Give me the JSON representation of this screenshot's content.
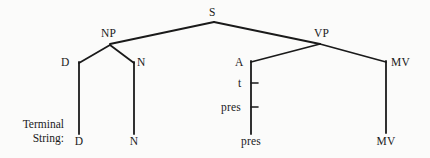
{
  "figure": {
    "type": "phrase-structure-tree",
    "background_color": "#fbfbfa",
    "ink_color": "#1a1a1a",
    "caption": {
      "line1": "Terminal",
      "line2": "String:"
    }
  },
  "nodes": {
    "s": "S",
    "np": "NP",
    "vp": "VP",
    "d": "D",
    "n": "N",
    "a": "A",
    "t": "t",
    "pres": "pres",
    "mv": "MV"
  },
  "terminals": {
    "d": "D",
    "n": "N",
    "pres": "pres",
    "mv": "MV"
  },
  "layout": {
    "node_positions": {
      "s": {
        "x": 215,
        "y": 12
      },
      "np": {
        "x": 110,
        "y": 33
      },
      "vp": {
        "x": 322,
        "y": 33
      },
      "d": {
        "x": 65,
        "y": 62
      },
      "n": {
        "x": 140,
        "y": 62
      },
      "a": {
        "x": 240,
        "y": 62
      },
      "t": {
        "x": 240,
        "y": 85
      },
      "pres": {
        "x": 240,
        "y": 111
      },
      "mv": {
        "x": 406,
        "y": 62
      }
    },
    "terminal_positions": {
      "d": {
        "x": 79,
        "y": 141
      },
      "n": {
        "x": 134,
        "y": 141
      },
      "pres": {
        "x": 251,
        "y": 141
      },
      "mv": {
        "x": 386,
        "y": 141
      }
    },
    "edges": [
      {
        "from": "s",
        "to": "np",
        "points": "214,22 110,44"
      },
      {
        "from": "s",
        "to": "vp",
        "points": "214,22 320,44"
      },
      {
        "from": "np",
        "to": "d",
        "points": "110,45 79,63"
      },
      {
        "from": "np",
        "to": "n",
        "points": "110,45 134,63"
      },
      {
        "from": "vp",
        "to": "a",
        "points": "320,44 251,62"
      },
      {
        "from": "vp",
        "to": "mv",
        "points": "320,44 386,62"
      },
      {
        "from": "d",
        "to": "terminal-d",
        "points": "79,63 79,134"
      },
      {
        "from": "n",
        "to": "terminal-n",
        "points": "134,63 134,134"
      },
      {
        "from": "a",
        "to": "terminal-pres",
        "points": "251,62 251,134"
      },
      {
        "from": "mv",
        "to": "terminal-mv",
        "points": "386,62 386,133"
      }
    ],
    "affix_ticks": [
      {
        "label": "t",
        "x": 251,
        "y": 83,
        "length": 7
      },
      {
        "label": "pres",
        "x": 251,
        "y": 107,
        "length": 7
      }
    ]
  }
}
